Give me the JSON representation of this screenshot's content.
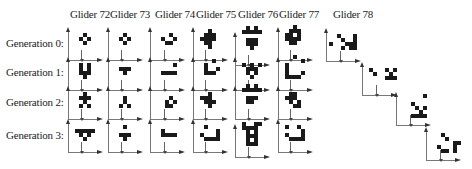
{
  "columns": [
    {
      "label": "Glider 72",
      "x": 70
    },
    {
      "label": "Glider 73",
      "x": 110
    },
    {
      "label": "Glider 74",
      "x": 155
    },
    {
      "label": "Glider 75",
      "x": 196
    },
    {
      "label": "Glider 76",
      "x": 238
    },
    {
      "label": "Glider 77",
      "x": 279
    },
    {
      "label": "Glider 78",
      "x": 333
    }
  ],
  "rows": [
    {
      "label": "Generation 0:",
      "y": 44
    },
    {
      "label": "Generation 1:",
      "y": 73
    },
    {
      "label": "Generation 2:",
      "y": 103
    },
    {
      "label": "Generation 3:",
      "y": 136
    }
  ],
  "cell_size": 4,
  "gliders": [
    {
      "name": "Glider 72",
      "generations": [
        {
          "ox": 68,
          "oy": 25,
          "tick": 13,
          "cells": [
            [
              3,
              0
            ],
            [
              2,
              1
            ],
            [
              4,
              1
            ],
            [
              3,
              2
            ]
          ]
        },
        {
          "ox": 68,
          "oy": 55,
          "tick": 13,
          "cells": [
            [
              2,
              0
            ],
            [
              4,
              0
            ],
            [
              2,
              1
            ],
            [
              4,
              1
            ],
            [
              2,
              2
            ],
            [
              3,
              2
            ],
            [
              4,
              2
            ],
            [
              3,
              3
            ]
          ]
        },
        {
          "ox": 68,
          "oy": 84,
          "tick": 13,
          "cells": [
            [
              3,
              0
            ],
            [
              2,
              1
            ],
            [
              3,
              1
            ],
            [
              4,
              1
            ],
            [
              3,
              2
            ],
            [
              2,
              3
            ],
            [
              4,
              3
            ]
          ]
        },
        {
          "ox": 68,
          "oy": 117,
          "tick": 13,
          "cells": [
            [
              1,
              1
            ],
            [
              2,
              1
            ],
            [
              3,
              1
            ],
            [
              4,
              1
            ],
            [
              5,
              1
            ],
            [
              2,
              2
            ],
            [
              4,
              2
            ],
            [
              3,
              3
            ]
          ]
        }
      ]
    },
    {
      "name": "Glider 73",
      "generations": [
        {
          "ox": 108,
          "oy": 25,
          "tick": 13,
          "cells": [
            [
              3,
              0
            ],
            [
              2,
              1
            ],
            [
              4,
              1
            ],
            [
              3,
              2
            ]
          ]
        },
        {
          "ox": 108,
          "oy": 55,
          "tick": 13,
          "cells": [
            [
              2,
              1
            ],
            [
              3,
              1
            ],
            [
              4,
              1
            ],
            [
              3,
              2
            ]
          ]
        },
        {
          "ox": 108,
          "oy": 84,
          "tick": 13,
          "cells": [
            [
              3,
              1
            ],
            [
              3,
              2
            ],
            [
              2,
              3
            ],
            [
              4,
              3
            ]
          ]
        },
        {
          "ox": 108,
          "oy": 117,
          "tick": 13,
          "cells": [
            [
              3,
              0
            ],
            [
              2,
              2
            ],
            [
              3,
              2
            ],
            [
              4,
              2
            ],
            [
              3,
              3
            ]
          ]
        }
      ]
    },
    {
      "name": "Glider 74",
      "generations": [
        {
          "ox": 150,
          "oy": 25,
          "tick": 14,
          "cells": [
            [
              4,
              0
            ],
            [
              2,
              1
            ],
            [
              5,
              1
            ],
            [
              3,
              2
            ],
            [
              4,
              2
            ]
          ]
        },
        {
          "ox": 150,
          "oy": 55,
          "tick": 14,
          "cells": [
            [
              5,
              0
            ],
            [
              2,
              2
            ],
            [
              3,
              2
            ],
            [
              4,
              2
            ],
            [
              5,
              2
            ]
          ]
        },
        {
          "ox": 150,
          "oy": 84,
          "tick": 14,
          "cells": [
            [
              4,
              1
            ],
            [
              3,
              2
            ],
            [
              5,
              2
            ],
            [
              3,
              3
            ],
            [
              4,
              3
            ]
          ]
        },
        {
          "ox": 150,
          "oy": 117,
          "tick": 14,
          "cells": [
            [
              2,
              1
            ],
            [
              2,
              2
            ],
            [
              3,
              2
            ],
            [
              4,
              2
            ],
            [
              5,
              2
            ]
          ]
        }
      ]
    },
    {
      "name": "Glider 75",
      "generations": [
        {
          "ox": 193,
          "oy": 25,
          "tick": 12,
          "cells": [
            [
              3,
              -1
            ],
            [
              2,
              0
            ],
            [
              3,
              0
            ],
            [
              4,
              0
            ],
            [
              1,
              1
            ],
            [
              2,
              1
            ],
            [
              3,
              1
            ],
            [
              4,
              1
            ],
            [
              2,
              2
            ],
            [
              3,
              2
            ],
            [
              3,
              3
            ]
          ]
        },
        {
          "ox": 193,
          "oy": 55,
          "tick": 12,
          "cells": [
            [
              4,
              -1
            ],
            [
              2,
              0
            ],
            [
              2,
              1
            ],
            [
              5,
              1
            ],
            [
              2,
              2
            ],
            [
              3,
              2
            ],
            [
              4,
              2
            ]
          ]
        },
        {
          "ox": 193,
          "oy": 84,
          "tick": 12,
          "cells": [
            [
              3,
              0
            ],
            [
              1,
              1
            ],
            [
              2,
              1
            ],
            [
              3,
              1
            ],
            [
              2,
              2
            ],
            [
              3,
              2
            ],
            [
              4,
              2
            ],
            [
              3,
              3
            ]
          ]
        },
        {
          "ox": 193,
          "oy": 117,
          "tick": 12,
          "cells": [
            [
              2,
              0
            ],
            [
              5,
              1
            ],
            [
              1,
              2
            ],
            [
              5,
              2
            ],
            [
              2,
              3
            ],
            [
              3,
              3
            ],
            [
              4,
              3
            ],
            [
              5,
              3
            ]
          ]
        }
      ]
    },
    {
      "name": "Glider 76",
      "generations": [
        {
          "ox": 235,
          "oy": 30,
          "tick": 13,
          "cells": [
            [
              2,
              -3
            ],
            [
              4,
              -3
            ],
            [
              1,
              -2
            ],
            [
              2,
              -2
            ],
            [
              3,
              -2
            ],
            [
              4,
              -2
            ],
            [
              5,
              -2
            ],
            [
              2,
              0
            ],
            [
              3,
              0
            ],
            [
              4,
              0
            ],
            [
              2,
              1
            ],
            [
              3,
              1
            ],
            [
              4,
              1
            ],
            [
              3,
              2
            ]
          ]
        },
        {
          "ox": 235,
          "oy": 55,
          "tick": 13,
          "cells": [
            [
              1,
              0
            ],
            [
              3,
              0
            ],
            [
              5,
              0
            ],
            [
              2,
              1
            ],
            [
              3,
              1
            ],
            [
              4,
              1
            ],
            [
              2,
              2
            ],
            [
              4,
              2
            ],
            [
              3,
              3
            ]
          ]
        },
        {
          "ox": 235,
          "oy": 84,
          "tick": 13,
          "cells": [
            [
              2,
              -2
            ],
            [
              4,
              -2
            ],
            [
              1,
              -1
            ],
            [
              2,
              -1
            ],
            [
              3,
              -1
            ],
            [
              4,
              -1
            ],
            [
              5,
              -1
            ],
            [
              2,
              1
            ],
            [
              3,
              1
            ],
            [
              4,
              1
            ],
            [
              2,
              2
            ],
            [
              3,
              2
            ]
          ]
        },
        {
          "ox": 235,
          "oy": 122,
          "tick": 13,
          "cells": [
            [
              1,
              -2
            ],
            [
              4,
              -2
            ],
            [
              5,
              -2
            ],
            [
              1,
              -1
            ],
            [
              2,
              -1
            ],
            [
              3,
              -1
            ],
            [
              4,
              -1
            ],
            [
              2,
              0
            ],
            [
              4,
              0
            ],
            [
              2,
              1
            ],
            [
              3,
              1
            ],
            [
              4,
              1
            ],
            [
              2,
              2
            ],
            [
              4,
              2
            ],
            [
              2,
              3
            ],
            [
              3,
              3
            ],
            [
              4,
              3
            ]
          ]
        }
      ]
    },
    {
      "name": "Glider 77",
      "generations": [
        {
          "ox": 278,
          "oy": 25,
          "tick": 12,
          "cells": [
            [
              3,
              -2
            ],
            [
              2,
              -1
            ],
            [
              3,
              -1
            ],
            [
              4,
              -1
            ],
            [
              1,
              0
            ],
            [
              2,
              0
            ],
            [
              4,
              0
            ],
            [
              1,
              1
            ],
            [
              2,
              1
            ],
            [
              3,
              1
            ],
            [
              4,
              1
            ],
            [
              2,
              2
            ],
            [
              3,
              2
            ]
          ]
        },
        {
          "ox": 278,
          "oy": 55,
          "tick": 12,
          "cells": [
            [
              3,
              -2
            ],
            [
              5,
              -1
            ],
            [
              1,
              0
            ],
            [
              1,
              1
            ],
            [
              1,
              2
            ],
            [
              5,
              2
            ],
            [
              1,
              3
            ],
            [
              2,
              3
            ],
            [
              3,
              3
            ],
            [
              4,
              3
            ]
          ]
        },
        {
          "ox": 278,
          "oy": 84,
          "tick": 12,
          "cells": [
            [
              2,
              0
            ],
            [
              3,
              0
            ],
            [
              1,
              1
            ],
            [
              2,
              1
            ],
            [
              3,
              1
            ],
            [
              2,
              2
            ],
            [
              4,
              2
            ],
            [
              3,
              3
            ],
            [
              4,
              3
            ]
          ]
        },
        {
          "ox": 278,
          "oy": 117,
          "tick": 12,
          "cells": [
            [
              1,
              0
            ],
            [
              4,
              0
            ],
            [
              1,
              2
            ],
            [
              5,
              1
            ],
            [
              5,
              2
            ],
            [
              2,
              3
            ],
            [
              3,
              3
            ],
            [
              4,
              3
            ],
            [
              5,
              3
            ]
          ]
        }
      ]
    },
    {
      "name": "Glider 78",
      "generations": [
        {
          "ox": 326,
          "oy": 26,
          "tick": 14,
          "cells": [
            [
              2,
              0
            ],
            [
              6,
              0
            ],
            [
              3,
              1
            ],
            [
              6,
              1
            ],
            [
              0,
              2
            ],
            [
              4,
              2
            ],
            [
              5,
              2
            ],
            [
              6,
              2
            ],
            [
              3,
              3
            ],
            [
              5,
              3
            ],
            [
              6,
              3
            ]
          ]
        },
        {
          "ox": 362,
          "oy": 60,
          "tick": 14,
          "cells": [
            [
              1,
              0
            ],
            [
              5,
              0
            ],
            [
              7,
              0
            ],
            [
              2,
              1
            ],
            [
              6,
              1
            ],
            [
              5,
              2
            ],
            [
              6,
              2
            ],
            [
              7,
              2
            ]
          ]
        },
        {
          "ox": 396,
          "oy": 90,
          "tick": 14,
          "cells": [
            [
              6,
              -1
            ],
            [
              3,
              1
            ],
            [
              4,
              2
            ],
            [
              6,
              2
            ],
            [
              5,
              3
            ],
            [
              3,
              4
            ],
            [
              4,
              4
            ],
            [
              5,
              4
            ],
            [
              6,
              4
            ]
          ]
        },
        {
          "ox": 426,
          "oy": 125,
          "tick": 14,
          "cells": [
            [
              3,
              0
            ],
            [
              4,
              1
            ],
            [
              2,
              3
            ],
            [
              6,
              2
            ],
            [
              7,
              2
            ],
            [
              3,
              4
            ],
            [
              4,
              4
            ],
            [
              6,
              3
            ],
            [
              6,
              4
            ]
          ]
        }
      ]
    }
  ]
}
